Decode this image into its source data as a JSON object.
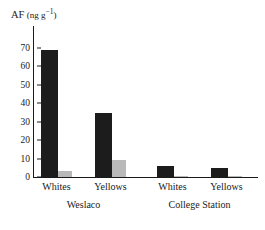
{
  "chart_data": {
    "type": "bar",
    "title_parts": {
      "main": "AF",
      "unit_open": "(ng g",
      "exponent": "−1",
      "unit_close": ")"
    },
    "xlabel": "",
    "ylabel": "AF (ng g−1)",
    "ylim": [
      0,
      75
    ],
    "yticks": [
      0,
      10,
      20,
      30,
      40,
      50,
      60,
      70
    ],
    "ytick_labels": [
      "0",
      "10",
      "20",
      "30",
      "40",
      "50",
      "60",
      "70"
    ],
    "grid": false,
    "legend": "none",
    "categories": [
      "Whites",
      "Yellows",
      "Whites",
      "Yellows"
    ],
    "groups": [
      {
        "label": "Weslaco",
        "categories": [
          "Whites",
          "Yellows"
        ]
      },
      {
        "label": "College Station",
        "categories": [
          "Whites",
          "Yellows"
        ]
      }
    ],
    "series": [
      {
        "name": "dark",
        "color": "#1c1c1c",
        "values": [
          69,
          35,
          6,
          5
        ]
      },
      {
        "name": "light",
        "color": "#b9b9b9",
        "values": [
          3,
          9.5,
          0.5,
          0.5
        ]
      }
    ]
  },
  "colors": {
    "dark_series": "#1c1c1c",
    "light_series": "#b9b9b9",
    "axis": "#1a1a1a",
    "background": "#ffffff"
  }
}
